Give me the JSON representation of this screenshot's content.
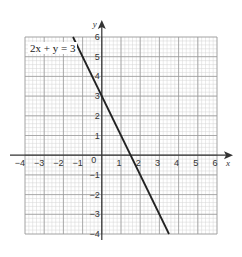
{
  "chart_data": {
    "type": "line",
    "title": "",
    "equation_label": "2x + y = 3",
    "xlabel": "x",
    "ylabel": "y",
    "xlim": [
      -4,
      6
    ],
    "ylim": [
      -4,
      6
    ],
    "x_ticks": [
      -4,
      -3,
      -2,
      -1,
      0,
      1,
      2,
      3,
      4,
      5,
      6
    ],
    "x_tick_labels": [
      "−4",
      "−3",
      "−2",
      "−1",
      "0",
      "1",
      "2",
      "3",
      "4",
      "5",
      "6"
    ],
    "y_ticks": [
      -4,
      -3,
      -2,
      -1,
      1,
      2,
      3,
      4,
      5,
      6
    ],
    "y_tick_labels": [
      "−4",
      "−3",
      "−2",
      "−1",
      "1",
      "2",
      "3",
      "4",
      "5",
      "6"
    ],
    "grid": true,
    "minor_divisions_per_unit": 5,
    "series": [
      {
        "name": "2x + y = 3",
        "x": [
          -1.5,
          3.5
        ],
        "y": [
          6,
          -4
        ],
        "color": "#222222"
      }
    ]
  },
  "colors": {
    "major_grid": "#9a9a9a",
    "minor_grid": "#d4d4d4",
    "axis": "#333333",
    "line": "#222222"
  }
}
